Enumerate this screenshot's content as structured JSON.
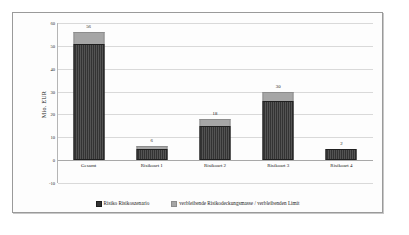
{
  "chart_data": {
    "type": "bar",
    "subtype": "stacked-bar",
    "title": "",
    "xlabel": "",
    "ylabel": "Mio. EUR",
    "categories": [
      "Gesamt",
      "Risikoart 1",
      "Risikoart 2",
      "Risikoart 3",
      "Risikoart 4"
    ],
    "series": [
      {
        "name": "Risiko Risikoszenario",
        "color": "#333333",
        "values": [
          51,
          5,
          15,
          26,
          5
        ]
      },
      {
        "name": "verbleibende Risikodeckungsmasse / verbleibenden Limit",
        "color": "#A6A6A6",
        "values": [
          5,
          1,
          3,
          4,
          -3
        ]
      }
    ],
    "total_labels": [
      "56",
      "6",
      "18",
      "30",
      "2"
    ],
    "totals": [
      56,
      6,
      18,
      30,
      2
    ],
    "ylim": [
      -10,
      60
    ],
    "yticks": [
      60,
      50,
      40,
      30,
      20,
      10,
      0,
      -10
    ],
    "ytick_labels": [
      "60",
      "50",
      "40",
      "30",
      "20",
      "10",
      "0",
      "-10"
    ],
    "grid": true,
    "legend_position": "bottom"
  },
  "legend": {
    "items": [
      {
        "label": "Risiko Risikoszenario",
        "swatch": "dark"
      },
      {
        "label": "verbleibende Risikodeckungsmasse / verbleibenden Limit",
        "swatch": "light"
      }
    ]
  },
  "footnote": {
    "text": ""
  }
}
